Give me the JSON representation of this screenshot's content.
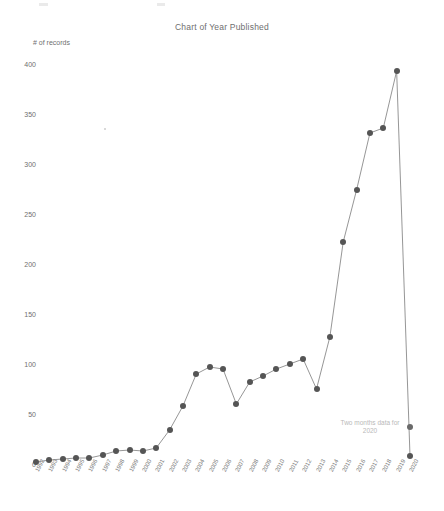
{
  "chart_data": {
    "type": "line",
    "title": "Chart of Year Published",
    "xlabel": "",
    "ylabel": "# of records",
    "ylim": [
      0,
      400
    ],
    "ytick_labels": [
      "0",
      "50",
      "100",
      "150",
      "200",
      "250",
      "300",
      "350",
      "400"
    ],
    "ytick_values": [
      0,
      50,
      100,
      150,
      200,
      250,
      300,
      350,
      400
    ],
    "grid": false,
    "legend": "none",
    "marker": "circle",
    "categories": [
      "1992",
      "1993",
      "1994",
      "1995",
      "1996",
      "1997",
      "1998",
      "1999",
      "2000",
      "2001",
      "2002",
      "2003",
      "2004",
      "2005",
      "2006",
      "2007",
      "2008",
      "2009",
      "2010",
      "2011",
      "2012",
      "2013",
      "2014",
      "2015",
      "2016",
      "2017",
      "2018",
      "2019",
      "2020"
    ],
    "values": [
      2,
      4,
      5,
      6,
      6,
      9,
      13,
      14,
      13,
      16,
      34,
      58,
      90,
      97,
      95,
      60,
      82,
      88,
      95,
      100,
      105,
      75,
      127,
      222,
      274,
      331,
      336,
      393,
      8
    ],
    "series": [
      {
        "name": "# of records",
        "values": [
          2,
          4,
          5,
          6,
          6,
          9,
          13,
          14,
          13,
          16,
          34,
          58,
          90,
          97,
          95,
          60,
          82,
          88,
          95,
          100,
          105,
          75,
          127,
          222,
          274,
          331,
          336,
          393,
          8
        ]
      }
    ],
    "annotations": [
      {
        "text": "Two months data for\n2020",
        "x": 2020,
        "y": 8
      }
    ],
    "colors": {
      "line": "#8a8a8a",
      "marker": "#555555",
      "text": "#6f6f6f",
      "annotation": "#b9b9b9",
      "background": "#ffffff"
    }
  },
  "annotation": {
    "text": "Two months data for\n2020"
  }
}
